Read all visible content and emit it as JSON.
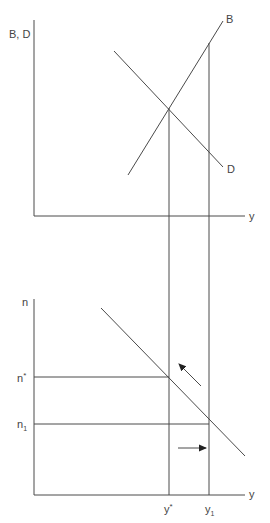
{
  "diagram": {
    "type": "economics-two-panel-equilibrium",
    "colors": {
      "line": "#4a4a4a",
      "text": "#444444",
      "background": "#ffffff"
    },
    "top_panel": {
      "y_axis_label": "B, D",
      "x_axis_label": "y",
      "curves": [
        {
          "name": "B",
          "label": "B",
          "slope": "upward"
        },
        {
          "name": "D",
          "label": "D",
          "slope": "downward"
        }
      ],
      "equilibrium": "intersection of B and D at y*"
    },
    "bottom_panel": {
      "y_axis_label": "n",
      "x_axis_label": "y",
      "y_ticks": [
        {
          "label": "n",
          "sup": "*"
        },
        {
          "label": "n",
          "sub": "1"
        }
      ],
      "x_ticks": [
        {
          "label": "y",
          "sup": "*"
        },
        {
          "label": "y",
          "sub": "1"
        }
      ],
      "arrows": [
        {
          "direction": "up-left",
          "meaning": "movement along curve toward equilibrium"
        },
        {
          "direction": "right",
          "meaning": "movement toward y1"
        }
      ]
    },
    "labels": {
      "top_y": "B, D",
      "top_x": "y",
      "curve_b": "B",
      "curve_d": "D",
      "bottom_y": "n",
      "bottom_x": "y",
      "n_star_base": "n",
      "n_star_sup": "*",
      "n1_base": "n",
      "n1_sub": "1",
      "y_star_base": "y",
      "y_star_sup": "*",
      "y1_base": "y",
      "y1_sub": "1"
    }
  }
}
